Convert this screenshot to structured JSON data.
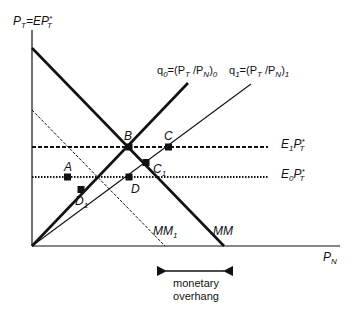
{
  "diagram": {
    "axes": {
      "y_label": {
        "base": "P",
        "sub": "T",
        "eq": "=EP",
        "sup": "*",
        "sub2": "T"
      },
      "x_label": {
        "base": "P",
        "sub": "N"
      }
    },
    "lines": {
      "q0": {
        "name": "q",
        "name_sub": "0",
        "eq": "=(P",
        "s1": "T",
        "mid": " /P",
        "s2": "N",
        "close": ")",
        "close_sub": "0"
      },
      "q1": {
        "name": "q",
        "name_sub": "1",
        "eq": "=(P",
        "s1": "T",
        "mid": " /P",
        "s2": "N",
        "close": ")",
        "close_sub": "1"
      },
      "E1": {
        "base": "E",
        "sub": "1",
        "p": "P",
        "sup": "*",
        "sub2": "T"
      },
      "E0": {
        "base": "E",
        "sub": "0",
        "p": "P",
        "sup": "*",
        "sub2": "T"
      },
      "MM": {
        "label": "MM"
      },
      "MM1": {
        "label": "MM",
        "sub": "1"
      }
    },
    "points": {
      "A": "A",
      "B": "B",
      "C": "C",
      "D": "D",
      "C1": {
        "base": "C",
        "sub": "1"
      },
      "D1": {
        "base": "D",
        "sub": "1"
      }
    },
    "annotation": {
      "line1": "monetary",
      "line2": "overhang"
    }
  }
}
